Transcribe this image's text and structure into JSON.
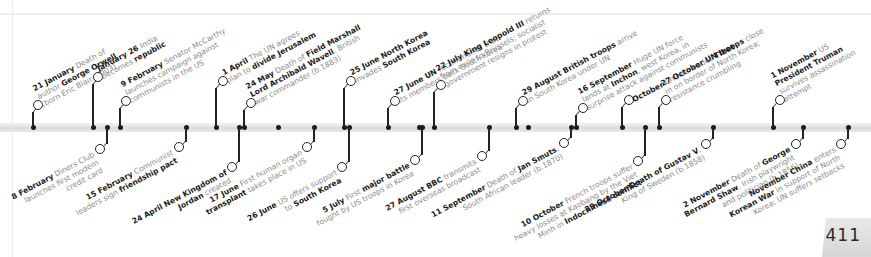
{
  "page": {
    "number": "411"
  },
  "timeline": {
    "above": [
      {
        "x": 33,
        "ring": [
          38,
          100
        ],
        "lines": [
          [
            {
              "b": "21 January"
            },
            {
              "t": " Death of"
            }
          ],
          [
            {
              "t": "author "
            },
            {
              "b": "George Orwell"
            }
          ],
          [
            {
              "t": "(born Eric Blair, 1903)"
            }
          ]
        ]
      },
      {
        "x": 93,
        "ring": [
          98,
          72
        ],
        "lines": [
          [
            {
              "b": "January 26"
            },
            {
              "t": " India"
            }
          ],
          [
            {
              "t": "becomes "
            },
            {
              "b": "republic"
            }
          ]
        ]
      },
      {
        "x": 120,
        "ring": [
          126,
          96
        ],
        "lines": [
          [
            {
              "b": "9 February"
            },
            {
              "t": " Senator McCarthy"
            }
          ],
          [
            {
              "t": "launches campaign against"
            }
          ],
          [
            {
              "t": "communists in the US"
            }
          ]
        ]
      },
      {
        "x": 216,
        "ring": [
          223,
          76
        ],
        "lines": [
          [
            {
              "b": "1 April"
            },
            {
              "t": " The UN agrees"
            }
          ],
          [
            {
              "t": "plan to "
            },
            {
              "b": "divide Jerusalem"
            }
          ]
        ]
      },
      {
        "x": 244,
        "ring": [
          251,
          98
        ],
        "lines": [
          [
            {
              "b": "24 May"
            },
            {
              "t": " Death of "
            },
            {
              "b": "Field Marshall"
            }
          ],
          [
            {
              "b": "Lord Archibald Wavell"
            },
            {
              "t": ", British"
            }
          ],
          [
            {
              "t": "war commander (b.1883)"
            }
          ]
        ]
      },
      {
        "x": 344,
        "ring": [
          351,
          76
        ],
        "lines": [
          [
            {
              "b": "25 June North Korea"
            }
          ],
          [
            {
              "t": "invades "
            },
            {
              "b": "South Korea"
            }
          ]
        ]
      },
      {
        "x": 388,
        "ring": [
          395,
          96
        ],
        "lines": [
          [
            {
              "b": "27 June UN"
            },
            {
              "t": " recommends that"
            }
          ],
          [
            {
              "t": "its members back South Korea"
            }
          ]
        ]
      },
      {
        "x": 434,
        "ring": [
          441,
          80
        ],
        "lines": [
          [
            {
              "b": "22 July King Leopold III"
            },
            {
              "t": " returns"
            }
          ],
          [
            {
              "t": "from exile to Brussels; socialist"
            }
          ],
          [
            {
              "t": "government resigns in protest"
            }
          ]
        ]
      },
      {
        "x": 516,
        "ring": [
          523,
          96
        ],
        "lines": [
          [
            {
              "b": "29 August British troops"
            },
            {
              "t": " arrive"
            }
          ],
          [
            {
              "t": "in South Korea under UN"
            }
          ]
        ]
      },
      {
        "x": 576,
        "ring": [
          583,
          103
        ],
        "lines": [
          [
            {
              "b": "16 September"
            },
            {
              "t": " Huge UN force"
            }
          ],
          [
            {
              "t": "lands at "
            },
            {
              "b": "Inchon"
            },
            {
              "t": ", west Korea, in"
            }
          ],
          [
            {
              "t": "surprise attack against communists"
            }
          ]
        ]
      },
      {
        "x": 622,
        "ring": [
          629,
          95
        ],
        "lines": [
          [
            {
              "b": "October"
            },
            {
              "t": " China invades "
            },
            {
              "b": "Tibet"
            }
          ]
        ]
      },
      {
        "x": 659,
        "ring": [
          666,
          95
        ],
        "lines": [
          [
            {
              "b": "27 October UN troops"
            },
            {
              "t": " close"
            }
          ],
          [
            {
              "t": "in on border of North Korea;"
            }
          ],
          [
            {
              "t": "resistance crumbling"
            }
          ]
        ]
      },
      {
        "x": 773,
        "ring": [
          780,
          95
        ],
        "lines": [
          [
            {
              "b": "1 November"
            },
            {
              "t": " US"
            }
          ],
          [
            {
              "b": "President Truman"
            }
          ],
          [
            {
              "t": "survives assassination"
            }
          ],
          [
            {
              "t": "attempt"
            }
          ]
        ]
      }
    ],
    "below": [
      {
        "x": 107,
        "ring": [
          100,
          148
        ],
        "lines": [
          [
            {
              "b": "8 February"
            },
            {
              "t": " Diners Club"
            }
          ],
          [
            {
              "t": "launches first modern"
            }
          ],
          [
            {
              "t": "credit card"
            }
          ]
        ]
      },
      {
        "x": 186,
        "ring": [
          179,
          146
        ],
        "lines": [
          [
            {
              "b": "15 February"
            },
            {
              "t": " Communist"
            }
          ],
          [
            {
              "t": "leaders sign "
            },
            {
              "b": "friendship pact"
            }
          ]
        ]
      },
      {
        "x": 239,
        "ring": [
          232,
          166
        ],
        "lines": [
          [
            {
              "b": "24 April New Kingdom of"
            }
          ],
          [
            {
              "b": "Jordan"
            },
            {
              "t": " created"
            }
          ]
        ]
      },
      {
        "x": 314,
        "ring": [
          307,
          146
        ],
        "lines": [
          [
            {
              "b": "17 June"
            },
            {
              "t": " First human organ"
            }
          ],
          [
            {
              "b": "transplant"
            },
            {
              "t": " takes place in US"
            }
          ]
        ]
      },
      {
        "x": 349,
        "ring": [
          342,
          166
        ],
        "lines": [
          [
            {
              "b": "26 June"
            },
            {
              "t": " US offers support"
            }
          ],
          [
            {
              "t": "to "
            },
            {
              "b": "South Korea"
            }
          ]
        ]
      },
      {
        "x": 422,
        "ring": [
          415,
          159
        ],
        "lines": [
          [
            {
              "b": "5 July"
            },
            {
              "t": " First "
            },
            {
              "b": "major battle"
            }
          ],
          [
            {
              "t": "fought by US troops in Korea"
            }
          ]
        ]
      },
      {
        "x": 489,
        "ring": [
          482,
          155
        ],
        "lines": [
          [
            {
              "b": "27 August BBC"
            },
            {
              "t": " transmits"
            }
          ],
          [
            {
              "t": "first overseas broadcast"
            }
          ]
        ]
      },
      {
        "x": 571,
        "ring": [
          564,
          142
        ],
        "lines": [
          [
            {
              "b": "11 September"
            },
            {
              "t": " Death of "
            },
            {
              "b": "Jan Smuts"
            },
            {
              "t": ","
            }
          ],
          [
            {
              "t": "South African leader (b.1870)"
            }
          ]
        ]
      },
      {
        "x": 645,
        "ring": [
          638,
          160
        ],
        "lines": [
          [
            {
              "b": "10 October"
            },
            {
              "t": " French troops suffer"
            }
          ],
          [
            {
              "t": "heavy losses at Kaobang by the Viet"
            }
          ],
          [
            {
              "t": "Minh in "
            },
            {
              "b": "Indochinese conflict"
            }
          ]
        ]
      },
      {
        "x": 713,
        "ring": [
          706,
          143
        ],
        "lines": [
          [
            {
              "b": "29 October Death of Gustav V"
            },
            {
              "t": ","
            }
          ],
          [
            {
              "t": "King of Sweden (b.1858)"
            }
          ]
        ]
      },
      {
        "x": 803,
        "ring": [
          796,
          143
        ],
        "lines": [
          [
            {
              "b": "2 November"
            },
            {
              "t": " Death of "
            },
            {
              "b": "George"
            }
          ],
          [
            {
              "b": "Bernard Shaw"
            },
            {
              "t": ", Irish playwright"
            }
          ],
          [
            {
              "t": "and politician (b.1856)"
            }
          ]
        ]
      },
      {
        "x": 848,
        "ring": [
          841,
          143
        ],
        "lines": [
          [
            {
              "b": "November China"
            },
            {
              "t": " enters"
            }
          ],
          [
            {
              "b": "Korean War"
            },
            {
              "t": " in support of North"
            }
          ],
          [
            {
              "t": "Korea; UN suffers setbacks"
            }
          ]
        ]
      }
    ],
    "extra_dots": [
      278,
      419,
      528
    ]
  }
}
